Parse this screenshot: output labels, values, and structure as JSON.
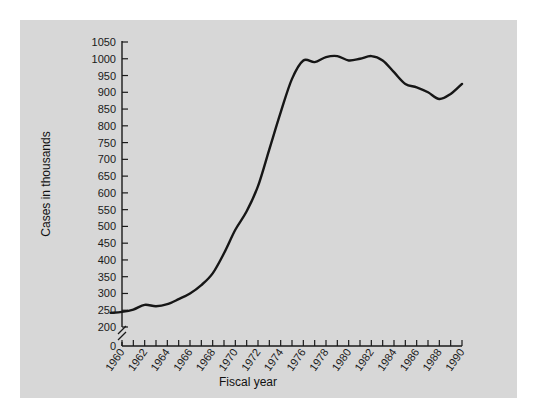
{
  "figure": {
    "background_color": "#d7d7d7",
    "page_color": "#ffffff",
    "line_color": "#161616"
  },
  "axes": {
    "y_title": "Cases in thousands",
    "x_title": "Fiscal year",
    "y_zero_label": "0",
    "y_axis_break": true
  },
  "chart_data": {
    "type": "line",
    "title": "",
    "subtitle": "",
    "xlabel": "Fiscal year",
    "ylabel": "Cases in thousands",
    "xlim": [
      1959,
      1990
    ],
    "ylim": [
      200,
      1050
    ],
    "y_break_below": 200,
    "grid": false,
    "legend": "none",
    "y_ticks": [
      200,
      250,
      300,
      350,
      400,
      450,
      500,
      550,
      600,
      650,
      700,
      750,
      800,
      850,
      900,
      950,
      1000,
      1050
    ],
    "y_tick_labels": [
      "200",
      "250",
      "300",
      "350",
      "400",
      "450",
      "500",
      "550",
      "600",
      "650",
      "700",
      "750",
      "800",
      "850",
      "900",
      "950",
      "1000",
      "1050"
    ],
    "x_ticks": [
      1960,
      1961,
      1962,
      1963,
      1964,
      1965,
      1966,
      1967,
      1968,
      1969,
      1970,
      1971,
      1972,
      1973,
      1974,
      1975,
      1976,
      1977,
      1978,
      1979,
      1980,
      1981,
      1982,
      1983,
      1984,
      1985,
      1986,
      1987,
      1988,
      1989,
      1990
    ],
    "x_tick_labels": [
      "1960",
      "",
      "1962",
      "",
      "1964",
      "",
      "1966",
      "",
      "1968",
      "",
      "1970",
      "",
      "1972",
      "",
      "1974",
      "",
      "1976",
      "",
      "1978",
      "",
      "1980",
      "",
      "1982",
      "",
      "1984",
      "",
      "1986",
      "",
      "1988",
      "",
      "1990"
    ],
    "x_labeled_years": [
      1960,
      1962,
      1964,
      1966,
      1968,
      1970,
      1972,
      1974,
      1976,
      1978,
      1980,
      1982,
      1984,
      1986,
      1988,
      1990
    ],
    "series": [
      {
        "name": "Cases",
        "x": [
          1959,
          1960,
          1961,
          1962,
          1963,
          1964,
          1965,
          1966,
          1967,
          1968,
          1969,
          1970,
          1971,
          1972,
          1973,
          1974,
          1975,
          1976,
          1977,
          1978,
          1979,
          1980,
          1981,
          1982,
          1983,
          1984,
          1985,
          1986,
          1987,
          1988,
          1989,
          1990
        ],
        "values": [
          242,
          245,
          252,
          266,
          262,
          268,
          283,
          300,
          325,
          360,
          420,
          490,
          545,
          620,
          730,
          840,
          940,
          995,
          990,
          1005,
          1008,
          995,
          1000,
          1008,
          995,
          960,
          925,
          915,
          900,
          880,
          895,
          925
        ]
      }
    ]
  }
}
